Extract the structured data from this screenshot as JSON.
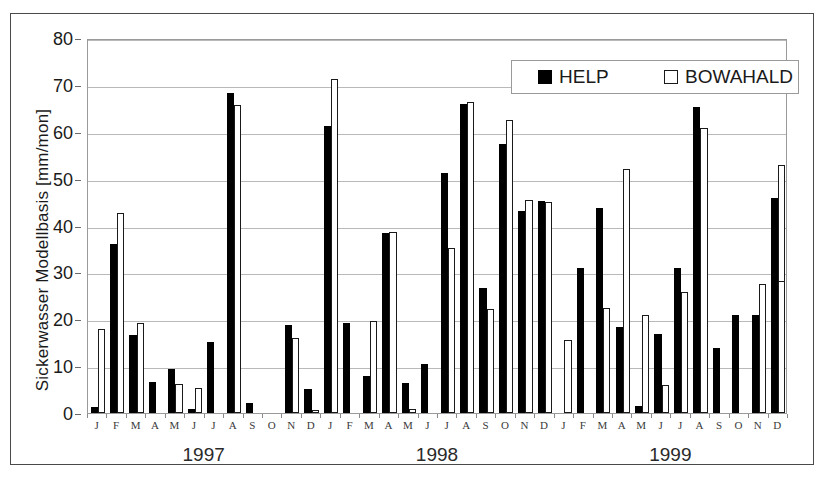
{
  "chart_data": {
    "type": "bar",
    "title": "",
    "xlabel": "",
    "ylabel": "Sickerwasser Modellbasis  [mm/mon]",
    "ylim": [
      0,
      80
    ],
    "yticks": [
      0,
      10,
      20,
      30,
      40,
      50,
      60,
      70,
      80
    ],
    "grid": true,
    "legend_position": "top-right",
    "legend": [
      "HELP",
      "BOWAHALD"
    ],
    "months": [
      "J",
      "F",
      "M",
      "A",
      "M",
      "J",
      "J",
      "A",
      "S",
      "O",
      "N",
      "D"
    ],
    "years": [
      "1997",
      "1998",
      "1999"
    ],
    "categories": [
      "1997-J",
      "1997-F",
      "1997-M",
      "1997-A",
      "1997-M",
      "1997-J",
      "1997-J",
      "1997-A",
      "1997-S",
      "1997-O",
      "1997-N",
      "1997-D",
      "1998-J",
      "1998-F",
      "1998-M",
      "1998-A",
      "1998-M",
      "1998-J",
      "1998-J",
      "1998-A",
      "1998-S",
      "1998-O",
      "1998-N",
      "1998-D",
      "1999-J",
      "1999-F",
      "1999-M",
      "1999-A",
      "1999-M",
      "1999-J",
      "1999-J",
      "1999-A",
      "1999-S",
      "1999-O",
      "1999-N",
      "1999-D"
    ],
    "series": [
      {
        "name": "HELP",
        "color": "#000000",
        "values": [
          1.2,
          36.0,
          16.6,
          6.7,
          9.3,
          0.8,
          15.1,
          68.3,
          2.2,
          0.0,
          18.7,
          5.1,
          61.3,
          19.3,
          7.8,
          38.3,
          6.3,
          10.4,
          51.2,
          66.0,
          26.6,
          57.4,
          43.0,
          45.2,
          0.0,
          30.9,
          43.8,
          18.4,
          1.6,
          16.9,
          30.9,
          65.2,
          13.9,
          21.0,
          21.0,
          45.9
        ]
      },
      {
        "name": "BOWAHALD",
        "color": "#ffffff",
        "values": [
          17.9,
          42.6,
          19.1,
          0.0,
          6.1,
          5.3,
          0.0,
          65.7,
          0.0,
          0.0,
          15.9,
          0.7,
          71.3,
          0.0,
          19.6,
          38.6,
          0.9,
          0.0,
          35.1,
          66.3,
          22.1,
          62.6,
          45.4,
          45.0,
          15.5,
          0.0,
          22.3,
          52.1,
          21.0,
          6.0,
          25.8,
          60.7,
          0.0,
          0.0,
          27.6,
          52.9
        ]
      },
      {
        "name": "BOWAHALD-extra",
        "color": "#ffffff",
        "values": [
          0,
          0,
          0,
          0,
          0,
          0,
          0,
          0,
          0,
          0,
          0,
          0,
          0,
          0,
          0,
          0,
          0,
          0,
          0,
          0,
          0,
          0,
          0,
          0,
          0,
          0,
          0,
          0,
          0,
          0,
          0,
          0,
          0,
          0,
          0,
          28.2
        ]
      }
    ]
  }
}
